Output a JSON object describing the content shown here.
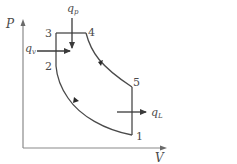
{
  "diagram": {
    "type": "P-V diagram (dual combustion cycle)",
    "axes": {
      "y_label": "P",
      "x_label": "V"
    },
    "points": [
      {
        "id": "1",
        "label": "1"
      },
      {
        "id": "2",
        "label": "2"
      },
      {
        "id": "3",
        "label": "3"
      },
      {
        "id": "4",
        "label": "4"
      },
      {
        "id": "5",
        "label": "5"
      }
    ],
    "heat_labels": {
      "qp_main": "q",
      "qp_sub": "p",
      "qv_main": "q",
      "qv_sub": "v",
      "ql_main": "q",
      "ql_sub": "L"
    },
    "colors": {
      "line": "#4a4a4a",
      "axis": "#8a8a8a",
      "background": "#ffffff"
    }
  }
}
